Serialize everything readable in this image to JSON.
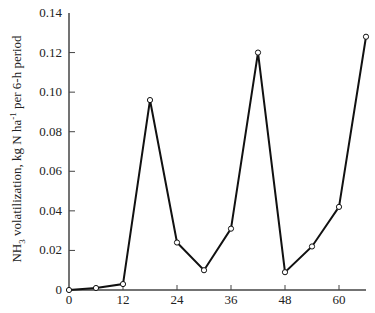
{
  "chart_data": {
    "type": "line",
    "title": "",
    "xlabel": "",
    "ylabel": "NH3 volatilization, kg N ha-1 per 6-h period",
    "ylabel_parts": {
      "pre": "NH",
      "sub": "3",
      "mid": " volatilization, kg N ha",
      "sup": "-1",
      "post": " per 6-h period"
    },
    "x": [
      0,
      6,
      12,
      18,
      24,
      30,
      36,
      42,
      48,
      54,
      60,
      66
    ],
    "series": [
      {
        "name": "NH3 volatilization",
        "values": [
          0.0,
          0.001,
          0.003,
          0.096,
          0.024,
          0.01,
          0.031,
          0.12,
          0.009,
          0.022,
          0.042,
          0.128
        ],
        "marker": "open-circle",
        "color": "#111111"
      }
    ],
    "xticks": [
      0,
      12,
      24,
      36,
      48,
      60
    ],
    "xtick_labels": [
      "0",
      "12",
      "24",
      "36",
      "48",
      "60"
    ],
    "yticks": [
      0,
      0.02,
      0.04,
      0.06,
      0.08,
      0.1,
      0.12,
      0.14
    ],
    "ytick_labels": [
      "0",
      "0.02",
      "0.04",
      "0.06",
      "0.08",
      "0.10",
      "0.12",
      "0.14"
    ],
    "xlim": [
      0,
      66
    ],
    "ylim": [
      0,
      0.14
    ],
    "grid": false,
    "legend": null
  }
}
